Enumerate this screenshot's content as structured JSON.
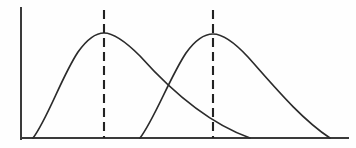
{
  "figure": {
    "background_color": "#fefefe",
    "width": 356,
    "height": 148
  },
  "chart_data": {
    "type": "line",
    "title": "",
    "subtitle": "",
    "xlabel": "",
    "ylabel": "",
    "xlim": [
      0,
      356
    ],
    "ylim": [
      0,
      148
    ],
    "grid": false,
    "legend": null,
    "axes": {
      "y_axis": {
        "x": 21,
        "y_top": 8,
        "y_bottom": 139,
        "color": "#3a3a3a",
        "width": 2
      },
      "x_axis": {
        "y": 138,
        "x_left": 21,
        "x_right": 348,
        "color": "#3a3a3a",
        "width": 2
      },
      "ticks": [],
      "tick_labels": []
    },
    "series": [
      {
        "name": "curve-1",
        "color": "#2b2b2b",
        "skew": "right",
        "start": [
          33,
          138
        ],
        "peak": [
          104,
          33
        ],
        "end": [
          250,
          138
        ],
        "path": "M 33 138 C 47 120, 62 76, 78 52 C 88 38, 96 33, 104 33 C 114 33, 126 42, 140 56 C 165 84, 205 122, 250 138"
      },
      {
        "name": "curve-2",
        "color": "#2b2b2b",
        "skew": "right",
        "start": [
          140,
          138
        ],
        "peak": [
          213,
          34
        ],
        "end": [
          330,
          138
        ],
        "path": "M 140 138 C 154 120, 170 77, 186 53 C 196 39, 205 34, 213 34 C 223 34, 235 43, 248 57 C 273 85, 300 118, 330 138"
      }
    ],
    "annotations": [
      {
        "name": "peak-line-1",
        "type": "vertical-dashed-line",
        "x": 104,
        "y_top": 10,
        "y_bottom": 138,
        "color": "#222222",
        "dash": "9 5",
        "marks": "peak of curve-1"
      },
      {
        "name": "peak-line-2",
        "type": "vertical-dashed-line",
        "x": 213,
        "y_top": 10,
        "y_bottom": 138,
        "color": "#222222",
        "dash": "9 5",
        "marks": "peak of curve-2"
      }
    ],
    "intersections": [
      {
        "name": "curve-crossing",
        "x": 163,
        "y": 80
      }
    ]
  }
}
